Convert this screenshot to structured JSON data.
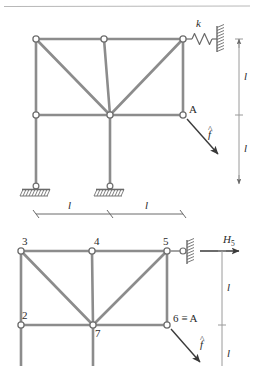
{
  "figure": {
    "title_rule": "",
    "upper": {
      "name": "two-story-frame-with-spring-and-load",
      "labels": {
        "spring_stiffness": "k",
        "node_A": "A",
        "force": "f",
        "force_hat": "^",
        "dim_vertical_top": "l",
        "dim_vertical_bottom": "l",
        "dim_horizontal_left": "l",
        "dim_horizontal_right": "l"
      },
      "elements": {
        "spring_icon": "coil-spring",
        "wall_icon": "hatched-wall",
        "support_icon": "pinned-support",
        "force_arrow_icon": "diagonal-arrow",
        "dimension_icon": "dimension-line"
      }
    },
    "lower": {
      "name": "numbered-node-frame-with-reaction",
      "node_labels": [
        "3",
        "4",
        "5",
        "2",
        "7",
        "6 ≡ A"
      ],
      "labels": {
        "reaction": "H",
        "reaction_sub": "5",
        "force": "f",
        "force_hat": "^",
        "dim_vertical_top": "l",
        "dim_vertical_bottom": "l"
      },
      "elements": {
        "link_support_icon": "horizontal-link-support",
        "wall_icon": "hatched-wall",
        "reaction_arrow_icon": "right-arrow",
        "force_arrow_icon": "diagonal-arrow",
        "dimension_icon": "dimension-line"
      }
    },
    "colors": {
      "member": "#8a8a8a",
      "node_stroke": "#6f6f6f",
      "node_fill": "#ffffff",
      "annotation": "#4a4a4a",
      "text": "#222222"
    }
  }
}
